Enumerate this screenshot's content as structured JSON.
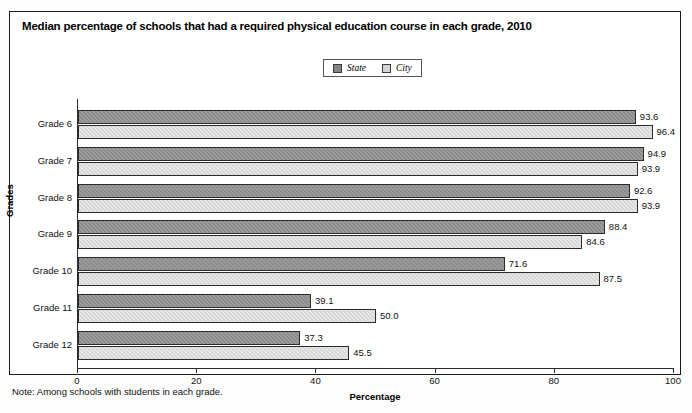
{
  "figure": {
    "title": "Median percentage of schools that had a required physical education course in each grade, 2010",
    "note": "Note: Among schools with students in each grade."
  },
  "legend": {
    "position": "top-center",
    "entries": [
      {
        "label": "State",
        "color": "#8a8a8a",
        "icon": "square-swatch"
      },
      {
        "label": "City",
        "color": "#d6d6d6",
        "icon": "square-swatch"
      }
    ]
  },
  "chart_data": {
    "type": "bar",
    "orientation": "horizontal",
    "title": "Median percentage of schools that had a required physical education course in each grade, 2010",
    "xlabel": "Percentage",
    "ylabel": "Grades",
    "xlim": [
      0,
      100
    ],
    "xticks": [
      0,
      20,
      40,
      60,
      80,
      100
    ],
    "xtick_labels": [
      "0",
      "20",
      "40",
      "60",
      "80",
      "100"
    ],
    "grid": false,
    "categories": [
      "Grade 6",
      "Grade 7",
      "Grade 8",
      "Grade 9",
      "Grade 10",
      "Grade 11",
      "Grade 12"
    ],
    "series": [
      {
        "name": "State",
        "color": "#8a8a8a",
        "values": [
          93.6,
          94.9,
          92.6,
          88.4,
          71.6,
          39.1,
          37.3
        ],
        "value_labels": [
          "93.6",
          "94.9",
          "92.6",
          "88.4",
          "71.6",
          "39.1",
          "37.3"
        ]
      },
      {
        "name": "City",
        "color": "#d6d6d6",
        "values": [
          96.4,
          93.9,
          93.9,
          84.6,
          87.5,
          50.0,
          45.5
        ],
        "value_labels": [
          "96.4",
          "93.9",
          "93.9",
          "84.6",
          "87.5",
          "50.0",
          "45.5"
        ]
      }
    ],
    "note": "Note: Among schools with students in each grade."
  }
}
